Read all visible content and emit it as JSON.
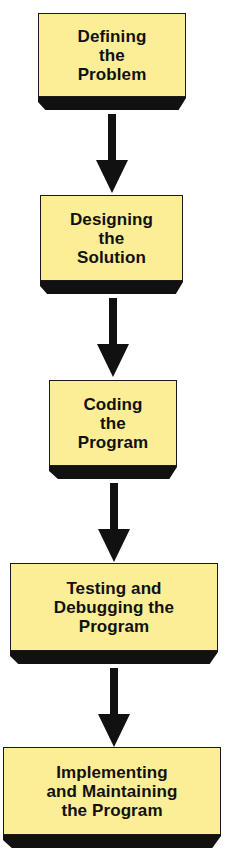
{
  "diagram": {
    "type": "flowchart",
    "direction": "top-to-bottom",
    "colors": {
      "box_fill": "#fbee96",
      "box_border": "#1a1a1a",
      "shadow": "#111111",
      "arrow": "#111111",
      "text": "#111111",
      "background": "#ffffff"
    },
    "steps": [
      {
        "label": "Defining\nthe\nProblem"
      },
      {
        "label": "Designing\nthe\nSolution"
      },
      {
        "label": "Coding\nthe\nProgram"
      },
      {
        "label": "Testing and\nDebugging the\nProgram"
      },
      {
        "label": "Implementing\nand Maintaining\nthe Program"
      }
    ],
    "connectors": [
      {
        "from": 0,
        "to": 1,
        "icon": "arrow-down-icon"
      },
      {
        "from": 1,
        "to": 2,
        "icon": "arrow-down-icon"
      },
      {
        "from": 2,
        "to": 3,
        "icon": "arrow-down-icon"
      },
      {
        "from": 3,
        "to": 4,
        "icon": "arrow-down-icon"
      }
    ]
  }
}
